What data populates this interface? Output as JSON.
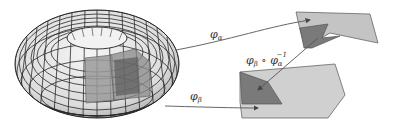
{
  "diagram": {
    "manifold": {
      "name": "torus"
    },
    "labels": {
      "phi_alpha": "φ",
      "phi_alpha_sub": "α",
      "phi_beta": "φ",
      "phi_beta_sub": "β",
      "transition_phi": "φ",
      "transition_beta_sub": "β",
      "transition_circ": " ∘ φ",
      "transition_alpha_sub": "α",
      "transition_inverse_sup": "−1"
    },
    "colors": {
      "torus_fill": "#e8e8e8",
      "grid_lines": "#2a2a2a",
      "patch_light": "#9a9a9a",
      "patch_dark": "#6e6e6e",
      "chart_light": "#c8c8c8",
      "chart_dark": "#7a7a7a",
      "arrow": "#444444"
    }
  }
}
